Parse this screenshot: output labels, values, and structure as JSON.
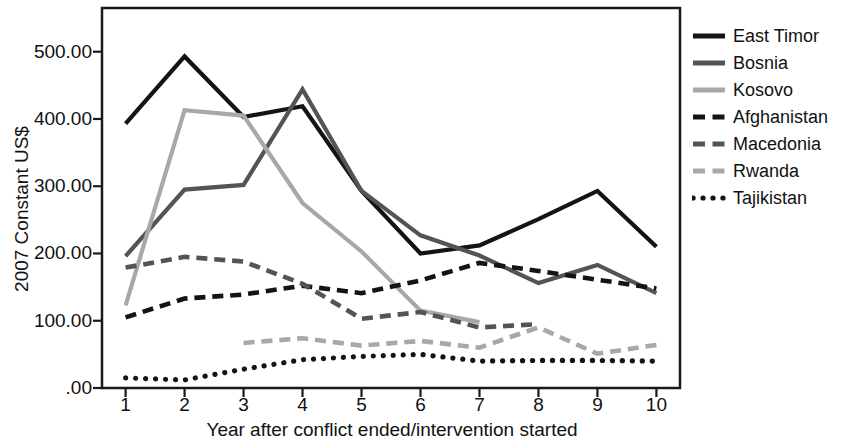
{
  "chart_data": {
    "type": "line",
    "title": "",
    "xlabel": "Year after conflict ended/intervention started",
    "ylabel": "2007 Constant US$",
    "x": [
      1,
      2,
      3,
      4,
      5,
      6,
      7,
      8,
      9,
      10
    ],
    "xtick_labels": [
      "1",
      "2",
      "3",
      "4",
      "5",
      "6",
      "7",
      "8",
      "9",
      "10"
    ],
    "ytick_labels": [
      ".00",
      "100.00",
      "200.00",
      "300.00",
      "400.00",
      "500.00"
    ],
    "ytick_values": [
      0,
      100,
      200,
      300,
      400,
      500
    ],
    "xlim": [
      0.6,
      10.4
    ],
    "ylim": [
      0,
      565
    ],
    "grid": false,
    "legend_position": "right",
    "series": [
      {
        "name": "East Timor",
        "color": "#141414",
        "style": "solid",
        "x": [
          1,
          2,
          3,
          4,
          5,
          6,
          7,
          8,
          9,
          10
        ],
        "values": [
          393,
          493,
          403,
          419,
          293,
          200,
          212,
          251,
          293,
          210
        ]
      },
      {
        "name": "Bosnia",
        "color": "#545454",
        "style": "solid",
        "x": [
          1,
          2,
          3,
          4,
          5,
          6,
          7,
          8,
          9,
          10
        ],
        "values": [
          196,
          295,
          302,
          444,
          293,
          227,
          197,
          156,
          183,
          141
        ]
      },
      {
        "name": "Kosovo",
        "color": "#a8a8a8",
        "style": "solid",
        "x": [
          1,
          2,
          3,
          4,
          5,
          6,
          7
        ],
        "values": [
          123,
          413,
          405,
          275,
          203,
          115,
          98
        ]
      },
      {
        "name": "Afghanistan",
        "color": "#141414",
        "style": "dashed",
        "x": [
          1,
          2,
          3,
          4,
          5,
          6,
          7,
          8,
          9,
          10
        ],
        "values": [
          105,
          133,
          139,
          152,
          141,
          160,
          186,
          174,
          161,
          148
        ]
      },
      {
        "name": "Macedonia",
        "color": "#545454",
        "style": "dashed",
        "x": [
          1,
          2,
          3,
          4,
          5,
          6,
          7,
          8
        ],
        "values": [
          179,
          195,
          188,
          155,
          103,
          113,
          90,
          95
        ]
      },
      {
        "name": "Rwanda",
        "color": "#a8a8a8",
        "style": "dashed",
        "x": [
          3,
          4,
          5,
          6,
          7,
          8,
          9,
          10
        ],
        "values": [
          67,
          74,
          63,
          70,
          60,
          90,
          51,
          64
        ]
      },
      {
        "name": "Tajikistan",
        "color": "#141414",
        "style": "dotted",
        "x": [
          1,
          2,
          3,
          4,
          5,
          6,
          7,
          8,
          9,
          10
        ],
        "values": [
          15,
          12,
          28,
          42,
          47,
          50,
          40,
          41,
          41,
          40
        ]
      }
    ]
  },
  "legend": {
    "items": [
      {
        "label": "East Timor"
      },
      {
        "label": "Bosnia"
      },
      {
        "label": "Kosovo"
      },
      {
        "label": "Afghanistan"
      },
      {
        "label": "Macedonia"
      },
      {
        "label": "Rwanda"
      },
      {
        "label": "Tajikistan"
      }
    ]
  }
}
